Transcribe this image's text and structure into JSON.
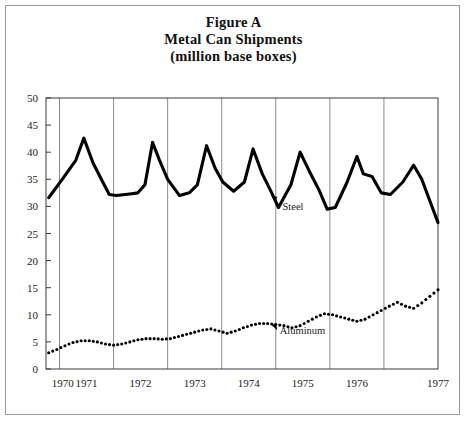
{
  "figure": {
    "title_line1": "Figure A",
    "title_line2": "Metal Can Shipments",
    "title_line3": "(million base boxes)"
  },
  "chart_data": {
    "type": "line",
    "title": "Figure A Metal Can Shipments (million base boxes)",
    "subtitle": "(million base boxes)",
    "xlabel": "",
    "ylabel": "",
    "xlim": [
      1969.75,
      1977.0
    ],
    "ylim": [
      0,
      50
    ],
    "yticks": [
      0,
      5,
      10,
      15,
      20,
      25,
      30,
      35,
      40,
      45,
      50
    ],
    "xticks": [
      1970,
      1971,
      1972,
      1973,
      1974,
      1975,
      1976,
      1977
    ],
    "xtick_labels": [
      "1970",
      "1971",
      "1972",
      "1973",
      "1974",
      "1975",
      "1976",
      "1977"
    ],
    "grid": "vertical-only",
    "legend": "inline-annotations",
    "annotations": [
      {
        "text": "Steel",
        "series": "Steel",
        "x": 1974.05,
        "y": 30.5
      },
      {
        "text": "Aluminum",
        "series": "Aluminum",
        "x": 1974.0,
        "y": 7.6
      }
    ],
    "series": [
      {
        "name": "Steel",
        "style": "solid-thick",
        "color": "#000000",
        "x": [
          1969.8,
          1970.05,
          1970.3,
          1970.45,
          1970.62,
          1970.8,
          1970.92,
          1971.05,
          1971.3,
          1971.45,
          1971.58,
          1971.72,
          1971.85,
          1972.0,
          1972.22,
          1972.4,
          1972.55,
          1972.72,
          1972.88,
          1973.02,
          1973.22,
          1973.42,
          1973.58,
          1973.75,
          1973.9,
          1974.05,
          1974.28,
          1974.45,
          1974.62,
          1974.8,
          1974.95,
          1975.1,
          1975.32,
          1975.5,
          1975.62,
          1975.78,
          1975.95,
          1976.12,
          1976.35,
          1976.55,
          1976.7,
          1976.85,
          1977.0
        ],
        "y": [
          31.6,
          35.0,
          38.5,
          42.6,
          38.0,
          34.5,
          32.2,
          32.0,
          32.3,
          32.5,
          34.0,
          41.8,
          38.5,
          35.0,
          32.0,
          32.5,
          34.0,
          41.2,
          37.0,
          34.5,
          32.8,
          34.5,
          40.6,
          36.0,
          33.0,
          29.8,
          34.0,
          40.0,
          36.5,
          33.0,
          29.5,
          29.8,
          34.5,
          39.2,
          36.0,
          35.5,
          32.5,
          32.2,
          34.5,
          37.6,
          35.0,
          31.0,
          27.0
        ]
      },
      {
        "name": "Aluminum",
        "style": "dotted",
        "color": "#000000",
        "x": [
          1969.8,
          1969.95,
          1970.1,
          1970.25,
          1970.4,
          1970.55,
          1970.7,
          1970.85,
          1971.0,
          1971.15,
          1971.3,
          1971.45,
          1971.6,
          1971.75,
          1971.9,
          1972.05,
          1972.2,
          1972.35,
          1972.5,
          1972.65,
          1972.8,
          1972.95,
          1973.1,
          1973.25,
          1973.4,
          1973.55,
          1973.7,
          1973.85,
          1974.0,
          1974.15,
          1974.3,
          1974.45,
          1974.6,
          1974.75,
          1974.9,
          1975.05,
          1975.2,
          1975.35,
          1975.5,
          1975.65,
          1975.8,
          1975.95,
          1976.1,
          1976.25,
          1976.4,
          1976.55,
          1976.7,
          1976.85,
          1977.0
        ],
        "y": [
          3.0,
          3.6,
          4.3,
          4.9,
          5.2,
          5.2,
          5.0,
          4.6,
          4.4,
          4.6,
          5.0,
          5.4,
          5.6,
          5.6,
          5.5,
          5.6,
          6.0,
          6.4,
          6.8,
          7.2,
          7.4,
          7.0,
          6.6,
          7.0,
          7.6,
          8.1,
          8.4,
          8.4,
          8.2,
          8.0,
          7.6,
          8.0,
          8.8,
          9.6,
          10.2,
          10.0,
          9.6,
          9.2,
          8.8,
          9.2,
          10.0,
          10.8,
          11.6,
          12.3,
          11.6,
          11.2,
          12.2,
          13.4,
          14.6
        ]
      }
    ]
  }
}
